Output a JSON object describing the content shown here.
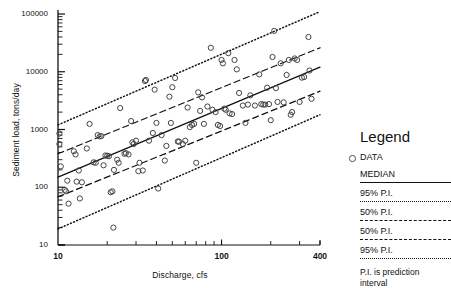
{
  "chart_data": {
    "type": "scatter",
    "title": "",
    "xlabel": "Discharge, cfs",
    "ylabel": "Sediment load, tons/day",
    "xscale": "log",
    "yscale": "log",
    "xlim": [
      10,
      400
    ],
    "ylim": [
      10,
      100000
    ],
    "xticks": [
      10,
      100,
      400
    ],
    "xtick_labels": [
      "10",
      "100",
      "400"
    ],
    "yticks": [
      10,
      100,
      1000,
      10000,
      100000
    ],
    "ytick_labels": [
      "10",
      "100",
      "1000",
      "10000",
      "100000"
    ],
    "grid": false,
    "legend_position": "right-outside",
    "series": [
      {
        "name": "DATA",
        "type": "scatter",
        "marker": "open-circle",
        "points": [
          [
            10.2,
            850
          ],
          [
            10.2,
            560
          ],
          [
            10.4,
            230
          ],
          [
            11.0,
            90
          ],
          [
            11.2,
            85
          ],
          [
            11.4,
            130
          ],
          [
            11.6,
            52
          ],
          [
            12.5,
            420
          ],
          [
            12.8,
            370
          ],
          [
            13.0,
            125
          ],
          [
            13.4,
            195
          ],
          [
            13.6,
            64
          ],
          [
            14.0,
            122
          ],
          [
            15.0,
            470
          ],
          [
            15.6,
            1250
          ],
          [
            16.5,
            270
          ],
          [
            17.0,
            265
          ],
          [
            17.5,
            800
          ],
          [
            18.0,
            760
          ],
          [
            18.4,
            770
          ],
          [
            19.0,
            240
          ],
          [
            19.5,
            355
          ],
          [
            20.0,
            350
          ],
          [
            20.5,
            345
          ],
          [
            21.0,
            82
          ],
          [
            21.5,
            85
          ],
          [
            21.8,
            20
          ],
          [
            22.0,
            200
          ],
          [
            23.0,
            300
          ],
          [
            23.5,
            265
          ],
          [
            24.0,
            2350
          ],
          [
            25.5,
            380
          ],
          [
            26.0,
            390
          ],
          [
            27.0,
            370
          ],
          [
            28.0,
            1400
          ],
          [
            28.5,
            600
          ],
          [
            29.0,
            560
          ],
          [
            30.0,
            640
          ],
          [
            31.0,
            190
          ],
          [
            31.5,
            265
          ],
          [
            33.0,
            195
          ],
          [
            34.0,
            6900
          ],
          [
            34.5,
            7200
          ],
          [
            36.0,
            640
          ],
          [
            38.0,
            870
          ],
          [
            39.0,
            4900
          ],
          [
            40.0,
            1300
          ],
          [
            41.0,
            95
          ],
          [
            43.0,
            800
          ],
          [
            45.0,
            290
          ],
          [
            46.0,
            520
          ],
          [
            48.0,
            3700
          ],
          [
            49.0,
            1300
          ],
          [
            50.0,
            5400
          ],
          [
            52.0,
            7800
          ],
          [
            54.0,
            620
          ],
          [
            55.0,
            615
          ],
          [
            58.0,
            560
          ],
          [
            60.0,
            640
          ],
          [
            62.0,
            2400
          ],
          [
            64.0,
            1100
          ],
          [
            66.0,
            1200
          ],
          [
            68.0,
            1250
          ],
          [
            70.0,
            265
          ],
          [
            72.0,
            4400
          ],
          [
            74.0,
            2100
          ],
          [
            76.0,
            3600
          ],
          [
            78.0,
            1250
          ],
          [
            82.0,
            2500
          ],
          [
            86.0,
            26000
          ],
          [
            88.0,
            2200
          ],
          [
            92.0,
            2000
          ],
          [
            95.0,
            1200
          ],
          [
            98.0,
            1150
          ],
          [
            100.0,
            16000
          ],
          [
            102.0,
            14000
          ],
          [
            104.0,
            2300
          ],
          [
            106.0,
            2200
          ],
          [
            110.0,
            21000
          ],
          [
            112.0,
            1900
          ],
          [
            116.0,
            1850
          ],
          [
            120.0,
            16000
          ],
          [
            124.0,
            11000
          ],
          [
            128.0,
            4300
          ],
          [
            135.0,
            2600
          ],
          [
            140.0,
            1300
          ],
          [
            145.0,
            2700
          ],
          [
            150.0,
            3900
          ],
          [
            160.0,
            2600
          ],
          [
            170.0,
            9000
          ],
          [
            175.0,
            2750
          ],
          [
            180.0,
            2700
          ],
          [
            185.0,
            2700
          ],
          [
            190.0,
            5300
          ],
          [
            195.0,
            2750
          ],
          [
            200.0,
            1450
          ],
          [
            205.0,
            18000
          ],
          [
            210.0,
            51000
          ],
          [
            215.0,
            5200
          ],
          [
            220.0,
            3000
          ],
          [
            230.0,
            14000
          ],
          [
            240.0,
            2950
          ],
          [
            250.0,
            8800
          ],
          [
            258.0,
            16000
          ],
          [
            265.0,
            1800
          ],
          [
            270.0,
            2000
          ],
          [
            280.0,
            17000
          ],
          [
            290.0,
            16000
          ],
          [
            300.0,
            3000
          ],
          [
            310.0,
            7900
          ],
          [
            320.0,
            8100
          ],
          [
            340.0,
            40000
          ],
          [
            345.0,
            10500
          ],
          [
            355.0,
            3400
          ]
        ]
      },
      {
        "name": "MEDIAN",
        "type": "line",
        "style": "solid",
        "endpoints": [
          [
            10,
            150
          ],
          [
            400,
            12000
          ]
        ]
      },
      {
        "name": "95% P.I. upper",
        "type": "line",
        "style": "dotted",
        "endpoints": [
          [
            10,
            1200
          ],
          [
            400,
            110000
          ]
        ]
      },
      {
        "name": "50% P.I. upper",
        "type": "line",
        "style": "dashed",
        "endpoints": [
          [
            10,
            380
          ],
          [
            400,
            26000
          ]
        ]
      },
      {
        "name": "50% P.I. lower",
        "type": "line",
        "style": "dashed",
        "endpoints": [
          [
            10,
            68
          ],
          [
            400,
            4600
          ]
        ]
      },
      {
        "name": "95% P.I. lower",
        "type": "line",
        "style": "dotted",
        "endpoints": [
          [
            10,
            19
          ],
          [
            400,
            1800
          ]
        ]
      }
    ]
  },
  "legend": {
    "title": "Legend",
    "data_label": "DATA",
    "median_label": "MEDIAN",
    "items": [
      {
        "label": "95% P.I.",
        "style": "dotted"
      },
      {
        "label": "50% P.I.",
        "style": "dashed"
      },
      {
        "label": "50% P.I.",
        "style": "dashed"
      },
      {
        "label": "95% P.I.",
        "style": "dotted"
      }
    ],
    "note": "P.I. is prediction interval"
  },
  "colors": {
    "ink": "#111111",
    "marker_stroke": "#444444",
    "background": "#ffffff"
  }
}
